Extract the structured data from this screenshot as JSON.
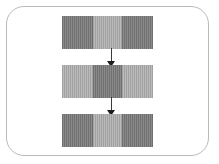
{
  "diagram": {
    "frame": {
      "label": "rounded-rectangle-container",
      "border_color": "#b9b9b9",
      "background_color": "#ffffff",
      "corner_radius": "18px"
    },
    "palette": {
      "dark_segment": "#7d7d7d",
      "light_segment": "#b3b3b3",
      "arrow_color": "#1d1d1d",
      "canvas_background": "#ffffff"
    },
    "rows": [
      {
        "index": 1,
        "name": "top-bar",
        "segments": [
          {
            "position": "left",
            "shade": "dark",
            "color": "#7d7d7d",
            "texture": "vertical-stripes"
          },
          {
            "position": "center",
            "shade": "light",
            "color": "#b3b3b3",
            "texture": "vertical-stripes"
          },
          {
            "position": "right",
            "shade": "dark",
            "color": "#7d7d7d",
            "texture": "vertical-stripes"
          }
        ]
      },
      {
        "index": 2,
        "name": "middle-bar",
        "segments": [
          {
            "position": "left",
            "shade": "light",
            "color": "#b3b3b3",
            "texture": "vertical-stripes"
          },
          {
            "position": "center",
            "shade": "dark",
            "color": "#7d7d7d",
            "texture": "vertical-stripes"
          },
          {
            "position": "right",
            "shade": "light",
            "color": "#b3b3b3",
            "texture": "vertical-stripes"
          }
        ]
      },
      {
        "index": 3,
        "name": "bottom-bar",
        "segments": [
          {
            "position": "left",
            "shade": "dark",
            "color": "#7d7d7d",
            "texture": "vertical-stripes"
          },
          {
            "position": "center",
            "shade": "light",
            "color": "#b3b3b3",
            "texture": "vertical-stripes"
          },
          {
            "position": "right",
            "shade": "dark",
            "color": "#7d7d7d",
            "texture": "vertical-stripes"
          }
        ]
      }
    ],
    "connectors": [
      {
        "index": 1,
        "name": "arrow-top-to-middle",
        "from": "top-bar",
        "to": "middle-bar",
        "direction": "down",
        "style": "solid-line-with-filled-arrowhead"
      },
      {
        "index": 2,
        "name": "arrow-middle-to-bottom",
        "from": "middle-bar",
        "to": "bottom-bar",
        "direction": "down",
        "style": "solid-line-with-filled-arrowhead"
      }
    ]
  }
}
